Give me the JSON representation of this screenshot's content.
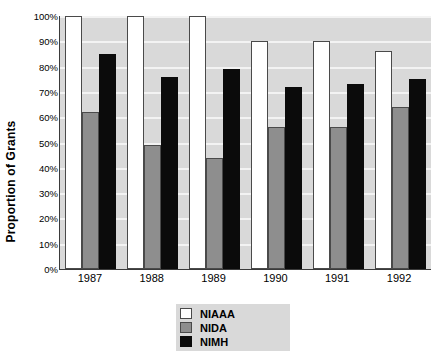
{
  "chart_data": {
    "type": "bar",
    "title": "",
    "xlabel": "",
    "ylabel": "Proportion of Grants",
    "categories": [
      "1987",
      "1988",
      "1989",
      "1990",
      "1991",
      "1992"
    ],
    "series": [
      {
        "name": "NIAAA",
        "color": "#ffffff",
        "values": [
          100,
          100,
          100,
          90,
          90,
          86
        ]
      },
      {
        "name": "NIDA",
        "color": "#8e8e8e",
        "values": [
          62,
          49,
          44,
          56,
          56,
          64
        ]
      },
      {
        "name": "NIMH",
        "color": "#0b0b0b",
        "values": [
          85,
          76,
          79,
          72,
          73,
          75
        ]
      }
    ],
    "ylim": [
      0,
      100
    ],
    "ytick_labels": [
      "100%",
      "90%",
      "80%",
      "70%",
      "60%",
      "50%",
      "40%",
      "30%",
      "20%",
      "10%",
      "0%"
    ],
    "ytick_values": [
      100,
      90,
      80,
      70,
      60,
      50,
      40,
      30,
      20,
      10,
      0
    ],
    "grid": true,
    "grid_color": "#f3f3f3",
    "plot_background": "#d9d9d9",
    "legend_position": "bottom-center",
    "legend": [
      "NIAAA",
      "NIDA",
      "NIMH"
    ]
  }
}
